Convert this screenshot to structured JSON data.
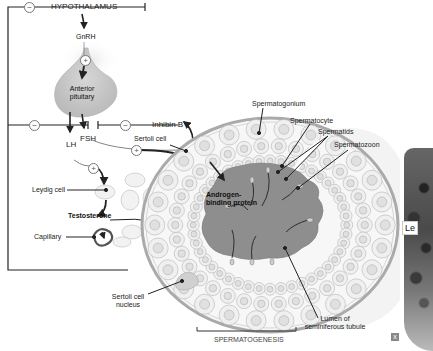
{
  "diagram": {
    "labels": {
      "hypothalamus": "HYPOTHALAMUS",
      "gnrh": "GnRH",
      "anterior_pituitary": "Anterior\npituitary",
      "fsh": "FSH",
      "lh": "LH",
      "inhibin_b": "Inhibin B",
      "sertoli_cell": "Sertoli cell",
      "leydig_cell": "Leydig cell",
      "testosterone": "Testosterone",
      "capillary": "Capillary",
      "androgen_binding_protein": "Androgen-\nbinding protein",
      "spermatogonium": "Spermatogonium",
      "spermatocyte": "Spermatocyte",
      "spermatids": "Spermatids",
      "spermatozoon": "Spermatozoon",
      "sertoli_cell_nucleus": "Sertoli cell\nnucleus",
      "lumen": "Lumen of\nseminiferous tubule",
      "spermatogenesis": "SPERMATOGENESIS"
    },
    "signs": {
      "inhibit": "−",
      "stimulate": "+"
    },
    "colors": {
      "line": "#222222",
      "pituitary": "#c8c8c8",
      "tubule_wall": "#bdbdbd",
      "lumen": "#8e8e8e",
      "cell_fill": "#efefef"
    }
  },
  "side_panel": {
    "section_letter": "A",
    "section_text": "S",
    "photo_label": "Le"
  },
  "corner_icon": "x"
}
